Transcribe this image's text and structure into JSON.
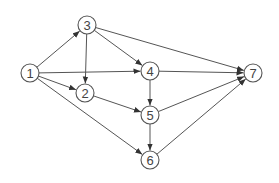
{
  "diagram": {
    "type": "directed-graph",
    "colors": {
      "stroke": "#555555",
      "text": "#444444",
      "background": "#ffffff"
    },
    "node_radius": 9,
    "nodes": [
      {
        "id": "1",
        "label": "1",
        "x": 30,
        "y": 73
      },
      {
        "id": "2",
        "label": "2",
        "x": 85,
        "y": 93
      },
      {
        "id": "3",
        "label": "3",
        "x": 87,
        "y": 25
      },
      {
        "id": "4",
        "label": "4",
        "x": 150,
        "y": 71
      },
      {
        "id": "5",
        "label": "5",
        "x": 150,
        "y": 115
      },
      {
        "id": "6",
        "label": "6",
        "x": 150,
        "y": 160
      },
      {
        "id": "7",
        "label": "7",
        "x": 253,
        "y": 73
      }
    ],
    "edges": [
      {
        "from": "1",
        "to": "3"
      },
      {
        "from": "1",
        "to": "4"
      },
      {
        "from": "1",
        "to": "2"
      },
      {
        "from": "1",
        "to": "6"
      },
      {
        "from": "3",
        "to": "2"
      },
      {
        "from": "3",
        "to": "4"
      },
      {
        "from": "3",
        "to": "7"
      },
      {
        "from": "2",
        "to": "5"
      },
      {
        "from": "4",
        "to": "5"
      },
      {
        "from": "4",
        "to": "7"
      },
      {
        "from": "5",
        "to": "6"
      },
      {
        "from": "5",
        "to": "7"
      },
      {
        "from": "6",
        "to": "7"
      }
    ]
  }
}
